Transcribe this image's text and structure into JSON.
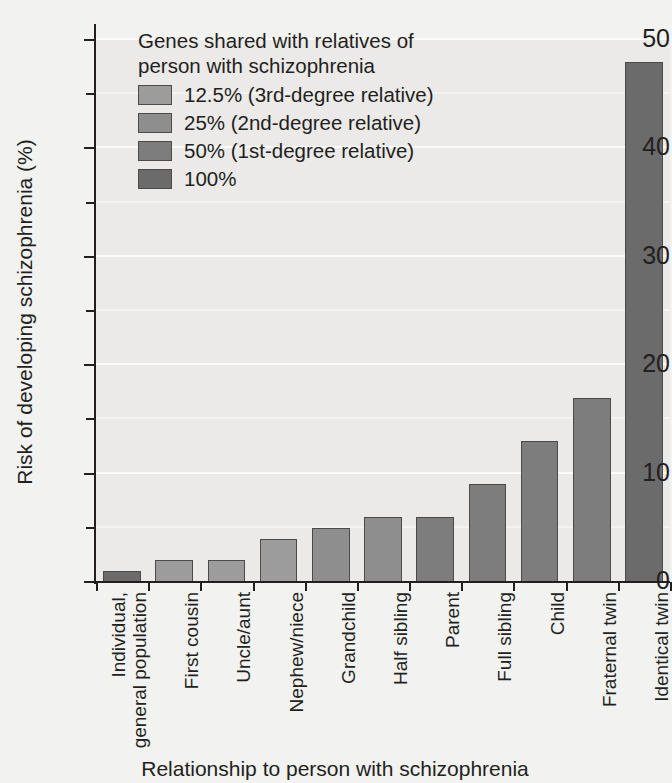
{
  "chart_data": {
    "type": "bar",
    "title": "",
    "xlabel": "Relationship to person with schizophrenia",
    "ylabel": "Risk of developing schizophrenia (%)",
    "ylim": [
      0,
      50
    ],
    "ytick_labels": [
      "0",
      "10",
      "20",
      "30",
      "40",
      "50"
    ],
    "ytick_values": [
      0,
      10,
      20,
      30,
      40,
      50
    ],
    "yminor_values": [
      5,
      15,
      25,
      35,
      45
    ],
    "grid": true,
    "legend_position": "upper-left-inside",
    "categories": [
      "Individual,\ngeneral population",
      "First cousin",
      "Uncle/aunt",
      "Nephew/niece",
      "Grandchild",
      "Half sibling",
      "Parent",
      "Full sibling",
      "Child",
      "Fraternal twin",
      "Identical twin"
    ],
    "values": [
      1,
      2,
      2,
      4,
      5,
      6,
      6,
      9,
      13,
      17,
      48
    ],
    "point_groups": [
      "100%",
      "12.5%",
      "12.5%",
      "12.5%",
      "25%",
      "25%",
      "50%",
      "50%",
      "50%",
      "50%",
      "100%"
    ],
    "bar_colors": [
      "#6b6b6b",
      "#9c9c9c",
      "#9c9c9c",
      "#9c9c9c",
      "#8e8e8e",
      "#8e8e8e",
      "#7d7d7d",
      "#7d7d7d",
      "#7d7d7d",
      "#7d7d7d",
      "#6b6b6b"
    ],
    "plot_background": "#ebeae8",
    "gridline_color": "#fbfbfa",
    "axis_color": "#231f20"
  },
  "legend": {
    "title": "Genes shared with relatives of\nperson with schizophrenia",
    "items": [
      {
        "label": "12.5% (3rd-degree relative)",
        "color": "#9c9c9c"
      },
      {
        "label": "25% (2nd-degree relative)",
        "color": "#8e8e8e"
      },
      {
        "label": "50% (1st-degree relative)",
        "color": "#7d7d7d"
      },
      {
        "label": "100%",
        "color": "#6b6b6b"
      }
    ]
  },
  "axes": {
    "y_title": "Risk of developing schizophrenia (%)",
    "x_title": "Relationship to person with schizophrenia"
  },
  "x_labels": [
    {
      "line1": "Individual,",
      "line2": "general population"
    },
    {
      "line1": "First cousin",
      "line2": ""
    },
    {
      "line1": "Uncle/aunt",
      "line2": ""
    },
    {
      "line1": "Nephew/niece",
      "line2": ""
    },
    {
      "line1": "Grandchild",
      "line2": ""
    },
    {
      "line1": "Half sibling",
      "line2": ""
    },
    {
      "line1": "Parent",
      "line2": ""
    },
    {
      "line1": "Full sibling",
      "line2": ""
    },
    {
      "line1": "Child",
      "line2": ""
    },
    {
      "line1": "Fraternal twin",
      "line2": ""
    },
    {
      "line1": "Identical twin",
      "line2": ""
    }
  ]
}
